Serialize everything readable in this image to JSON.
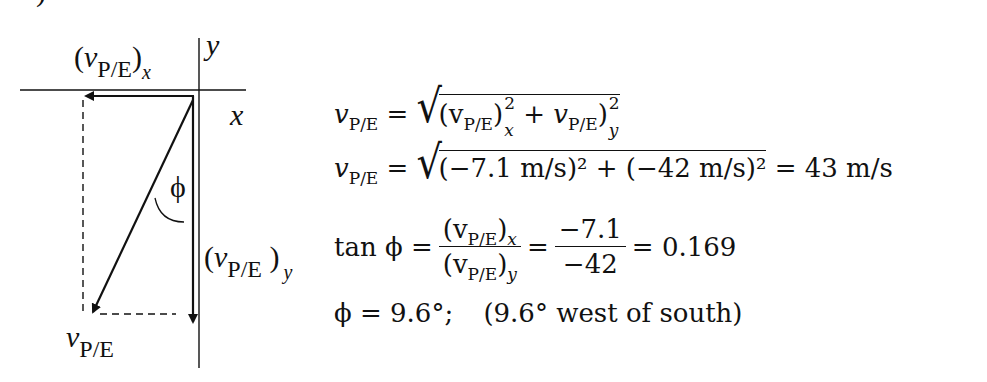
{
  "figure": {
    "top_fragment": ")",
    "diagram": {
      "axis_labels": {
        "x": "x",
        "y": "y"
      },
      "component_x_label": {
        "symbol": "v",
        "subscript": "P/E",
        "component": "x"
      },
      "component_y_label": {
        "symbol": "v",
        "subscript": "P/E",
        "component": "y"
      },
      "resultant_label": {
        "symbol": "v",
        "subscript": "P/E"
      },
      "angle_label": "ϕ"
    },
    "equations": {
      "line1": {
        "lhs": "v",
        "lhs_sub": "P/E",
        "eq": "=",
        "term1": "(v",
        "term1_sub": "P/E",
        "term1_close": ")",
        "term1_sup": "2",
        "term1_idx": "x",
        "plus": "+",
        "term2": "v",
        "term2_sub": "P/E",
        "term2_close": ")",
        "term2_sup": "2",
        "term2_idx": "y"
      },
      "line2": {
        "lhs": "v",
        "lhs_sub": "P/E",
        "eq": "=",
        "radicand": "(−7.1 m/s)² + (−42 m/s)²",
        "result": "= 43 m/s"
      },
      "line3": {
        "lhs": "tan ϕ =",
        "num1": "(v",
        "num1_sub": "P/E",
        "num1_close": ")",
        "num1_idx": "x",
        "den1": "(v",
        "den1_sub": "P/E",
        "den1_close": ")",
        "den1_idx": "y",
        "eq2": "=",
        "num2": "−7.1",
        "den2": "−42",
        "result": "= 0.169"
      },
      "line4": {
        "text": "ϕ = 9.6°;",
        "note": "(9.6° west of south)"
      }
    }
  }
}
